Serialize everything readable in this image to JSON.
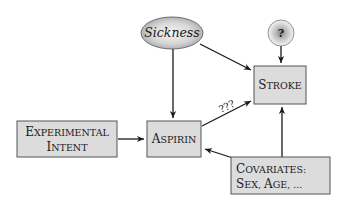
{
  "diagram": {
    "type": "causal-graph",
    "colors": {
      "box_fill": "#dcdcdc",
      "box_stroke": "#555555",
      "edge": "#1a1a1a",
      "text": "#1a1a1a"
    },
    "nodes": [
      {
        "id": "sickness",
        "shape": "ellipse",
        "style": "italic",
        "label": "Sickness"
      },
      {
        "id": "unknown",
        "shape": "circle",
        "style": "bold",
        "label": "?"
      },
      {
        "id": "stroke",
        "shape": "box",
        "style": "small-caps",
        "label_first": "S",
        "label_rest": "TROKE",
        "label": "Stroke"
      },
      {
        "id": "aspirin",
        "shape": "box",
        "style": "small-caps",
        "label_first": "A",
        "label_rest": "SPIRIN",
        "label": "Aspirin"
      },
      {
        "id": "intent",
        "shape": "box",
        "style": "small-caps",
        "line1_first": "E",
        "line1_rest": "XPERIMENTAL",
        "line2_first": "I",
        "line2_rest": "NTENT",
        "label": "Experimental Intent"
      },
      {
        "id": "covariates",
        "shape": "box",
        "style": "small-caps",
        "line1_first": "C",
        "line1_rest": "OVARIATES:",
        "line2_parts": [
          {
            "first": "S",
            "rest": "EX, "
          },
          {
            "first": "A",
            "rest": "GE, ..."
          }
        ],
        "label": "Covariates: Sex, Age, ..."
      }
    ],
    "edges": [
      {
        "from": "sickness",
        "to": "aspirin",
        "label": ""
      },
      {
        "from": "sickness",
        "to": "stroke",
        "label": ""
      },
      {
        "from": "unknown",
        "to": "stroke",
        "label": ""
      },
      {
        "from": "aspirin",
        "to": "stroke",
        "label": "???"
      },
      {
        "from": "intent",
        "to": "aspirin",
        "label": ""
      },
      {
        "from": "covariates",
        "to": "aspirin",
        "label": ""
      },
      {
        "from": "covariates",
        "to": "stroke",
        "label": ""
      }
    ]
  }
}
